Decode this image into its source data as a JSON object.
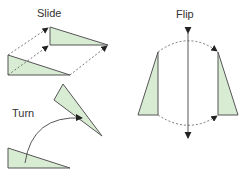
{
  "diagram": {
    "colors": {
      "fill": "#d8ecd4",
      "stroke": "#555555",
      "arrow": "#222222"
    },
    "labels": {
      "slide": "Slide",
      "turn": "Turn",
      "flip": "Flip"
    },
    "shapes": {
      "slide_original": "8,55 8,75 70,75",
      "slide_image": "50,27 50,45 108,45",
      "turn_original": "8,148 8,168 70,168",
      "turn_image": "63,84 54,100 102,136",
      "flip_left": "158,52 138,115 158,115",
      "flip_right": "218,52 218,115 238,115"
    }
  }
}
